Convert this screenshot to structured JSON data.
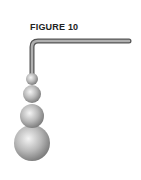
{
  "figure": {
    "title": "FIGURE 10",
    "rod_color": "#8a8a8a",
    "sphere_color": "#b5b5b5",
    "spheres": [
      {
        "cx": 32,
        "cy": 79,
        "r": 6
      },
      {
        "cx": 32,
        "cy": 94,
        "r": 9
      },
      {
        "cx": 32,
        "cy": 116,
        "r": 12
      },
      {
        "cx": 32,
        "cy": 143,
        "r": 18
      }
    ]
  }
}
